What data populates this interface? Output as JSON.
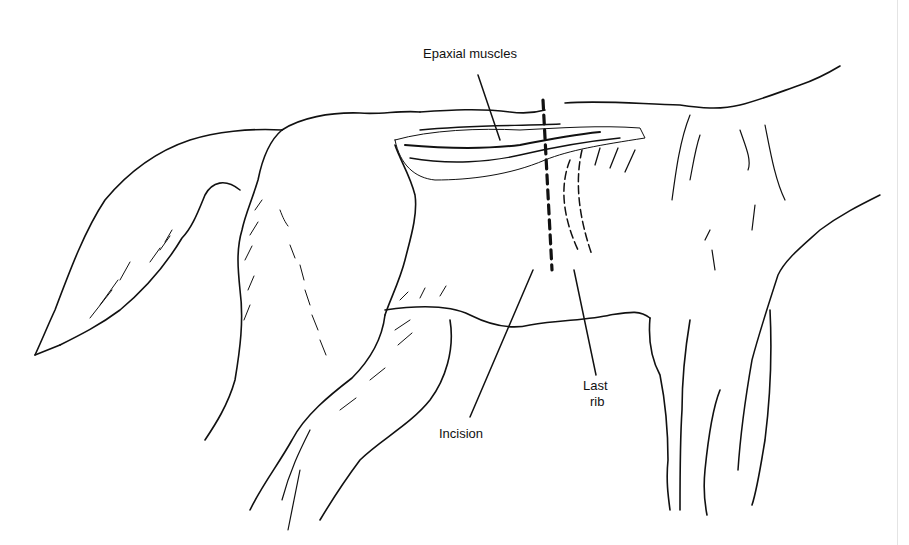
{
  "figure": {
    "labels": {
      "epaxial": "Epaxial muscles",
      "incision": "Incision",
      "last_rib_line1": "Last",
      "last_rib_line2": "rib"
    },
    "colors": {
      "ink": "#111111",
      "background": "#ffffff",
      "edge_line": "#e4e4e4"
    }
  }
}
